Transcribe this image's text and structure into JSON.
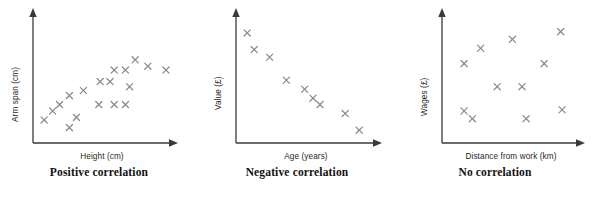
{
  "figure": {
    "panel_count": 3
  },
  "panels": [
    {
      "id": "positive-correlation",
      "caption": "Positive correlation",
      "x_label": "Height (cm)",
      "y_label": "Arm span (cm)",
      "marker": "x"
    },
    {
      "id": "negative-correlation",
      "caption": "Negative correlation",
      "x_label": "Age (years)",
      "y_label": "Value (£)",
      "marker": "x"
    },
    {
      "id": "no-correlation",
      "caption": "No correlation",
      "x_label": "Distance from work (km)",
      "y_label": "Wages (£)",
      "marker": "x"
    }
  ],
  "chart_data": [
    {
      "type": "scatter",
      "title": "Positive correlation",
      "xlabel": "Height (cm)",
      "ylabel": "Arm span (cm)",
      "xlim": [
        0,
        100
      ],
      "ylim": [
        0,
        100
      ],
      "grid": false,
      "legend": "none",
      "marker": "x",
      "marker_color": "#8a8a8a",
      "points": [
        {
          "x": 8,
          "y": 18
        },
        {
          "x": 14,
          "y": 25
        },
        {
          "x": 19,
          "y": 30
        },
        {
          "x": 26,
          "y": 12
        },
        {
          "x": 31,
          "y": 20
        },
        {
          "x": 26,
          "y": 37
        },
        {
          "x": 36,
          "y": 41
        },
        {
          "x": 47,
          "y": 30
        },
        {
          "x": 48,
          "y": 48
        },
        {
          "x": 55,
          "y": 48
        },
        {
          "x": 58,
          "y": 30
        },
        {
          "x": 66,
          "y": 30
        },
        {
          "x": 58,
          "y": 57
        },
        {
          "x": 66,
          "y": 57
        },
        {
          "x": 69,
          "y": 44
        },
        {
          "x": 73,
          "y": 65
        },
        {
          "x": 82,
          "y": 60
        },
        {
          "x": 95,
          "y": 57
        }
      ]
    },
    {
      "type": "scatter",
      "title": "Negative correlation",
      "xlabel": "Age (years)",
      "ylabel": "Value (£)",
      "xlim": [
        0,
        100
      ],
      "ylim": [
        0,
        100
      ],
      "grid": false,
      "legend": "none",
      "marker": "x",
      "marker_color": "#8a8a8a",
      "points": [
        {
          "x": 8,
          "y": 86
        },
        {
          "x": 13,
          "y": 73
        },
        {
          "x": 24,
          "y": 67
        },
        {
          "x": 36,
          "y": 49
        },
        {
          "x": 49,
          "y": 42
        },
        {
          "x": 55,
          "y": 35
        },
        {
          "x": 60,
          "y": 30
        },
        {
          "x": 78,
          "y": 23
        },
        {
          "x": 88,
          "y": 10
        }
      ]
    },
    {
      "type": "scatter",
      "title": "No correlation",
      "xlabel": "Distance from work (km)",
      "ylabel": "Wages (£)",
      "xlim": [
        0,
        100
      ],
      "ylim": [
        0,
        100
      ],
      "grid": false,
      "legend": "none",
      "marker": "x",
      "marker_color": "#8a8a8a",
      "points": [
        {
          "x": 16,
          "y": 62
        },
        {
          "x": 28,
          "y": 74
        },
        {
          "x": 51,
          "y": 81
        },
        {
          "x": 74,
          "y": 62
        },
        {
          "x": 86,
          "y": 87
        },
        {
          "x": 40,
          "y": 44
        },
        {
          "x": 58,
          "y": 44
        },
        {
          "x": 16,
          "y": 25
        },
        {
          "x": 22,
          "y": 19
        },
        {
          "x": 61,
          "y": 19
        },
        {
          "x": 87,
          "y": 26
        }
      ]
    }
  ],
  "colors": {
    "marker": "#8a8a8a",
    "axis": "#3a3a3a",
    "label": "#262626",
    "caption": "#111111",
    "background": "#ffffff"
  }
}
